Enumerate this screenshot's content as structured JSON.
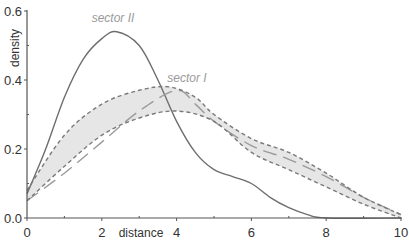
{
  "chart_data": {
    "type": "line",
    "title": "",
    "xlabel": "distance",
    "ylabel": "density",
    "xlim": [
      0,
      10
    ],
    "ylim": [
      0,
      0.6
    ],
    "x_ticks": [
      "0",
      "2",
      "4",
      "6",
      "8",
      "10"
    ],
    "y_ticks": [
      "0.0",
      "0.2",
      "0.4",
      "0.6"
    ],
    "grid": false,
    "legend": "inline annotations",
    "annotations": [
      {
        "text": "sector II",
        "x": 2.3,
        "y": 0.57
      },
      {
        "text": "sector I",
        "x": 4.3,
        "y": 0.4
      }
    ],
    "series": [
      {
        "name": "sector II",
        "style": "solid",
        "color": "#6e6e6e",
        "x": [
          0,
          0.5,
          1,
          1.5,
          2,
          2.4,
          3,
          3.5,
          4,
          4.5,
          5,
          5.5,
          6,
          6.5,
          7,
          7.5,
          8,
          10
        ],
        "y": [
          0.07,
          0.2,
          0.35,
          0.46,
          0.52,
          0.54,
          0.5,
          0.4,
          0.28,
          0.19,
          0.14,
          0.12,
          0.1,
          0.06,
          0.03,
          0.01,
          0.0,
          0.0
        ]
      },
      {
        "name": "sector I",
        "style": "long-dash",
        "color": "#9a9a9a",
        "x": [
          0,
          1,
          2,
          3,
          4,
          4.5,
          5,
          6,
          7,
          8,
          9,
          10
        ],
        "y": [
          0.05,
          0.13,
          0.22,
          0.31,
          0.37,
          0.33,
          0.28,
          0.21,
          0.17,
          0.12,
          0.06,
          0.01
        ]
      },
      {
        "name": "envelope upper",
        "style": "dotted",
        "color": "#7a7a7a",
        "x": [
          0,
          1,
          2,
          3,
          3.8,
          4.5,
          5,
          6,
          7,
          8,
          9,
          10
        ],
        "y": [
          0.08,
          0.24,
          0.33,
          0.37,
          0.38,
          0.35,
          0.3,
          0.23,
          0.19,
          0.13,
          0.06,
          0.01
        ]
      },
      {
        "name": "envelope lower",
        "style": "dotted",
        "color": "#7a7a7a",
        "x": [
          0,
          1,
          2,
          3,
          4,
          5,
          6,
          7,
          8,
          9,
          10
        ],
        "y": [
          0.05,
          0.15,
          0.24,
          0.29,
          0.31,
          0.28,
          0.19,
          0.14,
          0.09,
          0.04,
          0.0
        ]
      }
    ],
    "band_fill": "#e6e6e6"
  }
}
